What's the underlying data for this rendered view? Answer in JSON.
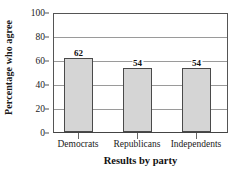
{
  "chart_data": {
    "type": "bar",
    "title": "",
    "categories": [
      "Democrats",
      "Republicans",
      "Independents"
    ],
    "values": [
      62,
      54,
      54
    ],
    "xlabel": "Results by party",
    "ylabel": "Percentage who agree",
    "ylim": [
      0,
      100
    ],
    "yticks": [
      0,
      20,
      40,
      60,
      80,
      100
    ],
    "ytick_labels": [
      "0",
      "20",
      "40",
      "60",
      "80",
      "100"
    ],
    "grid": true,
    "legend": false,
    "data_labels": [
      "62",
      "54",
      "54"
    ],
    "bar_fill_color": "#d5d5d5",
    "bar_border_color": "#4a4a4a",
    "gridline_color": "#9a9a9a",
    "axis_color": "#555555"
  }
}
